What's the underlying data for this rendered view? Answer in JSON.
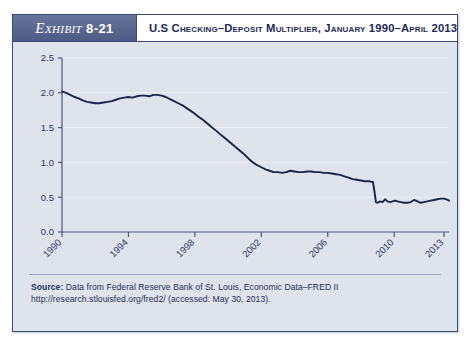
{
  "exhibit": {
    "label": "Exhibit",
    "number": "8-21",
    "title": "U.S Checking–Deposit Multiplier, January 1990–April 2013"
  },
  "source": {
    "label": "Source:",
    "text": " Data from Federal Reserve Bank of St. Louis, Economic Data–FRED II http://research.stlouisfed.org/fred2/ (accessed: May 30, 2013)."
  },
  "colors": {
    "panel_bg": "#dfe3ec",
    "panel_border": "#3c4a74",
    "tag_bg": "#5a6890",
    "line": "#1b2449",
    "axis": "#4a5780",
    "grid": "#eef1f6",
    "text": "#22305c"
  },
  "chart_data": {
    "type": "line",
    "title": "U.S Checking–Deposit Multiplier, January 1990–April 2013",
    "xlabel": "",
    "ylabel": "",
    "xlim": [
      1990,
      2013.3
    ],
    "ylim": [
      0.0,
      2.5
    ],
    "yticks": [
      0.0,
      0.5,
      1.0,
      1.5,
      2.0,
      2.5
    ],
    "ytick_labels": [
      "0.0",
      "0.5",
      "1.0",
      "1.5",
      "2.0",
      "2.5"
    ],
    "xticks": [
      1990,
      1994,
      1998,
      2002,
      2006,
      2010,
      2013
    ],
    "xtick_labels": [
      "1990",
      "1994",
      "1998",
      "2002",
      "2006",
      "2010",
      "2013"
    ],
    "grid": true,
    "legend": false,
    "series": [
      {
        "name": "Checking-deposit multiplier",
        "x": [
          1990.0,
          1990.25,
          1990.5,
          1990.75,
          1991.0,
          1991.25,
          1991.5,
          1991.75,
          1992.0,
          1992.25,
          1992.5,
          1992.75,
          1993.0,
          1993.25,
          1993.5,
          1993.75,
          1994.0,
          1994.25,
          1994.5,
          1994.75,
          1995.0,
          1995.25,
          1995.5,
          1995.75,
          1996.0,
          1996.25,
          1996.5,
          1996.75,
          1997.0,
          1997.25,
          1997.5,
          1997.75,
          1998.0,
          1998.25,
          1998.5,
          1998.75,
          1999.0,
          1999.25,
          1999.5,
          1999.75,
          2000.0,
          2000.25,
          2000.5,
          2000.75,
          2001.0,
          2001.25,
          2001.5,
          2001.75,
          2002.0,
          2002.25,
          2002.5,
          2002.75,
          2003.0,
          2003.25,
          2003.5,
          2003.75,
          2004.0,
          2004.25,
          2004.5,
          2004.75,
          2005.0,
          2005.25,
          2005.5,
          2005.75,
          2006.0,
          2006.25,
          2006.5,
          2006.75,
          2007.0,
          2007.25,
          2007.5,
          2007.75,
          2008.0,
          2008.25,
          2008.5,
          2008.62,
          2008.72,
          2008.8,
          2008.9,
          2009.0,
          2009.15,
          2009.3,
          2009.45,
          2009.6,
          2009.75,
          2009.9,
          2010.05,
          2010.2,
          2010.4,
          2010.6,
          2010.8,
          2011.0,
          2011.2,
          2011.4,
          2011.6,
          2011.8,
          2012.0,
          2012.2,
          2012.4,
          2012.6,
          2012.8,
          2013.0,
          2013.15,
          2013.3
        ],
        "values": [
          2.02,
          2.0,
          1.97,
          1.94,
          1.92,
          1.89,
          1.87,
          1.86,
          1.85,
          1.85,
          1.86,
          1.87,
          1.88,
          1.9,
          1.92,
          1.93,
          1.94,
          1.93,
          1.95,
          1.96,
          1.96,
          1.95,
          1.97,
          1.97,
          1.96,
          1.94,
          1.91,
          1.88,
          1.85,
          1.82,
          1.78,
          1.74,
          1.7,
          1.65,
          1.61,
          1.56,
          1.51,
          1.46,
          1.41,
          1.36,
          1.31,
          1.26,
          1.21,
          1.16,
          1.11,
          1.05,
          1.0,
          0.96,
          0.93,
          0.9,
          0.88,
          0.86,
          0.86,
          0.85,
          0.86,
          0.88,
          0.87,
          0.86,
          0.86,
          0.87,
          0.87,
          0.86,
          0.86,
          0.85,
          0.85,
          0.84,
          0.83,
          0.82,
          0.8,
          0.78,
          0.76,
          0.75,
          0.74,
          0.73,
          0.73,
          0.72,
          0.72,
          0.6,
          0.43,
          0.42,
          0.44,
          0.43,
          0.47,
          0.44,
          0.43,
          0.44,
          0.45,
          0.44,
          0.43,
          0.42,
          0.42,
          0.43,
          0.46,
          0.44,
          0.42,
          0.43,
          0.44,
          0.45,
          0.46,
          0.47,
          0.48,
          0.48,
          0.47,
          0.45
        ]
      }
    ]
  }
}
